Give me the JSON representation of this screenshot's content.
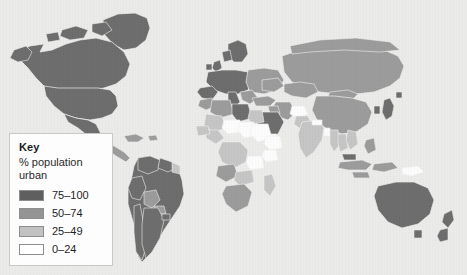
{
  "figure": {
    "kind": "choropleth-world-map",
    "background_color": "#ececea",
    "ocean_color": "#ececea",
    "border_color": "#f2f2f0",
    "width": 467,
    "height": 275
  },
  "legend": {
    "title": "Key",
    "subtitle_line_1": "% population",
    "subtitle_line_2": "urban",
    "box_color": "#fdfdfd",
    "box_border_color": "#c9c9c7",
    "classes": [
      {
        "label": "75–100",
        "color": "#5f5f5f",
        "min": 75,
        "max": 100
      },
      {
        "label": "50–74",
        "color": "#949494",
        "min": 50,
        "max": 74
      },
      {
        "label": "25–49",
        "color": "#c2c2c2",
        "min": 25,
        "max": 49
      },
      {
        "label": "0–24",
        "color": "#ffffff",
        "min": 0,
        "max": 24
      }
    ]
  },
  "chart_data": {
    "type": "map",
    "title": "",
    "variable": "% population urban",
    "projection": "world-equirectangular-ish",
    "class_breaks": [
      {
        "label": "75–100",
        "color": "#5f5f5f"
      },
      {
        "label": "50–74",
        "color": "#949494"
      },
      {
        "label": "25–49",
        "color": "#c2c2c2"
      },
      {
        "label": "0–24",
        "color": "#ffffff"
      }
    ],
    "regions": [
      {
        "name": "Greenland",
        "class": "75–100"
      },
      {
        "name": "Canada",
        "class": "75–100"
      },
      {
        "name": "United States",
        "class": "75–100"
      },
      {
        "name": "Mexico",
        "class": "75–100"
      },
      {
        "name": "Central America",
        "class": "50–74"
      },
      {
        "name": "Caribbean",
        "class": "50–74"
      },
      {
        "name": "Colombia",
        "class": "75–100"
      },
      {
        "name": "Venezuela",
        "class": "75–100"
      },
      {
        "name": "Guyana region",
        "class": "25–49"
      },
      {
        "name": "Brazil",
        "class": "75–100"
      },
      {
        "name": "Peru",
        "class": "75–100"
      },
      {
        "name": "Bolivia",
        "class": "50–74"
      },
      {
        "name": "Chile",
        "class": "75–100"
      },
      {
        "name": "Argentina",
        "class": "75–100"
      },
      {
        "name": "Paraguay",
        "class": "50–74"
      },
      {
        "name": "Uruguay",
        "class": "75–100"
      },
      {
        "name": "United Kingdom",
        "class": "75–100"
      },
      {
        "name": "Western Europe",
        "class": "75–100"
      },
      {
        "name": "Scandinavia",
        "class": "75–100"
      },
      {
        "name": "Eastern Europe",
        "class": "50–74"
      },
      {
        "name": "Russia",
        "class": "50–74"
      },
      {
        "name": "Ukraine",
        "class": "50–74"
      },
      {
        "name": "Turkey",
        "class": "50–74"
      },
      {
        "name": "Morocco",
        "class": "50–74"
      },
      {
        "name": "Algeria",
        "class": "50–74"
      },
      {
        "name": "Libya",
        "class": "75–100"
      },
      {
        "name": "Egypt",
        "class": "25–49"
      },
      {
        "name": "Sudan",
        "class": "0–24"
      },
      {
        "name": "Chad",
        "class": "0–24"
      },
      {
        "name": "Niger",
        "class": "0–24"
      },
      {
        "name": "Mali",
        "class": "25–49"
      },
      {
        "name": "Nigeria",
        "class": "25–49"
      },
      {
        "name": "Ethiopia",
        "class": "0–24"
      },
      {
        "name": "Kenya",
        "class": "0–24"
      },
      {
        "name": "Dem. Rep. Congo",
        "class": "25–49"
      },
      {
        "name": "Angola",
        "class": "50–74"
      },
      {
        "name": "Tanzania",
        "class": "0–24"
      },
      {
        "name": "Zambia",
        "class": "25–49"
      },
      {
        "name": "South Africa",
        "class": "50–74"
      },
      {
        "name": "Madagascar",
        "class": "25–49"
      },
      {
        "name": "Saudi Arabia",
        "class": "75–100"
      },
      {
        "name": "Iran",
        "class": "50–74"
      },
      {
        "name": "Iraq",
        "class": "50–74"
      },
      {
        "name": "Yemen",
        "class": "0–24"
      },
      {
        "name": "Afghanistan",
        "class": "0–24"
      },
      {
        "name": "Pakistan",
        "class": "25–49"
      },
      {
        "name": "India",
        "class": "25–49"
      },
      {
        "name": "Nepal",
        "class": "0–24"
      },
      {
        "name": "Bangladesh",
        "class": "0–24"
      },
      {
        "name": "China",
        "class": "50–74"
      },
      {
        "name": "Mongolia",
        "class": "50–74"
      },
      {
        "name": "Kazakhstan",
        "class": "50–74"
      },
      {
        "name": "Japan",
        "class": "75–100"
      },
      {
        "name": "South Korea",
        "class": "75–100"
      },
      {
        "name": "Thailand",
        "class": "25–49"
      },
      {
        "name": "Vietnam",
        "class": "25–49"
      },
      {
        "name": "Myanmar",
        "class": "25–49"
      },
      {
        "name": "Indonesia",
        "class": "50–74"
      },
      {
        "name": "Philippines",
        "class": "50–74"
      },
      {
        "name": "Malaysia",
        "class": "75–100"
      },
      {
        "name": "Papua New Guinea",
        "class": "0–24"
      },
      {
        "name": "Australia",
        "class": "75–100"
      },
      {
        "name": "New Zealand",
        "class": "75–100"
      }
    ]
  }
}
